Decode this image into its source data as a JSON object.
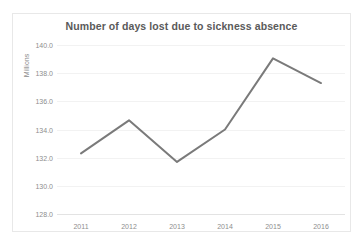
{
  "chart_data": {
    "type": "line",
    "title": "Number of days lost due to sickness absence",
    "xlabel": "",
    "ylabel": "Millions",
    "categories": [
      "2011",
      "2012",
      "2013",
      "2014",
      "2015",
      "2016"
    ],
    "values": [
      132.3,
      134.65,
      131.7,
      134.0,
      139.05,
      137.3
    ],
    "series": [
      {
        "name": "Days lost",
        "values": [
          132.3,
          134.65,
          131.7,
          134.0,
          139.05,
          137.3
        ]
      }
    ],
    "ylim": [
      128.0,
      140.0
    ],
    "ytick_step": 2.0,
    "ytick_labels": [
      "128.0",
      "130.0",
      "132.0",
      "134.0",
      "136.0",
      "138.0",
      "140.0"
    ],
    "ytick_values": [
      128.0,
      130.0,
      132.0,
      134.0,
      136.0,
      138.0,
      140.0
    ],
    "grid": true,
    "grid_axis": "y",
    "legend": false,
    "legend_position": "none",
    "markers": false,
    "line_color": "#7a7a7a",
    "grid_color": "#f2f2f2",
    "title_color": "#5a5a5a",
    "tick_color": "#8e8e8e",
    "border_color": "#e8e8e8",
    "background_color": "#ffffff"
  }
}
